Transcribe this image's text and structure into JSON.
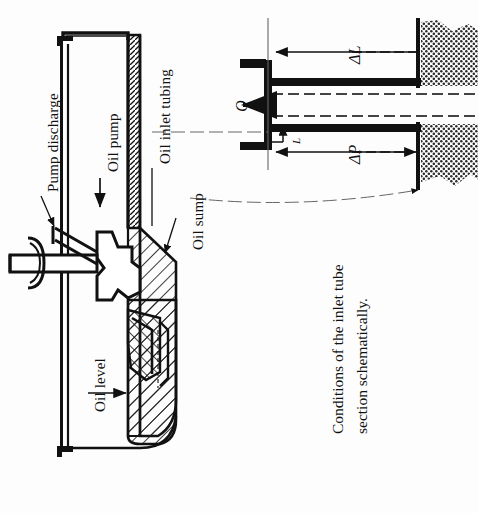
{
  "figure": {
    "kind": "engineering-cross-section",
    "orientation": "rotated-90-ccw",
    "caption": {
      "line1": "Conditions of the inlet tube",
      "line2": "section schematically."
    },
    "colors": {
      "ink": "#111111",
      "paper": "#fdfdfd",
      "hatch": "#1a1a1a",
      "stipple": "#2b2b2b",
      "leader": "#333333"
    }
  },
  "left_diagram": {
    "name": "oil-pump-sump-cross-section",
    "labels": {
      "pump_discharge": "Pump discharge",
      "oil_pump": "Oil pump",
      "oil_inlet_tubing": "Oil inlet tubing",
      "oil_sump": "Oil sump",
      "oil_level": "Oil level"
    }
  },
  "right_diagram": {
    "name": "inlet-tube-detail",
    "labels": {
      "flow_rate": "Q",
      "delta_L": "ΔL",
      "delta_P": "ΔP",
      "tube_wall": "L"
    }
  }
}
